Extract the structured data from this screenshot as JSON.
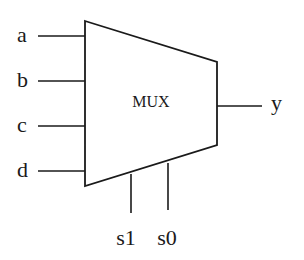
{
  "diagram": {
    "block": {
      "label": "MUX",
      "shape": "trapezoid",
      "points": [
        [
          85,
          21
        ],
        [
          217,
          62
        ],
        [
          217,
          145
        ],
        [
          85,
          186
        ]
      ],
      "stroke": "#1a1a1a",
      "fill": "#ffffff"
    },
    "inputs": [
      {
        "name": "a",
        "y": 36
      },
      {
        "name": "b",
        "y": 81
      },
      {
        "name": "c",
        "y": 126
      },
      {
        "name": "d",
        "y": 171
      }
    ],
    "output": {
      "name": "y",
      "y": 106
    },
    "selects": [
      {
        "name": "s1",
        "x": 131
      },
      {
        "name": "s0",
        "x": 168
      }
    ]
  }
}
